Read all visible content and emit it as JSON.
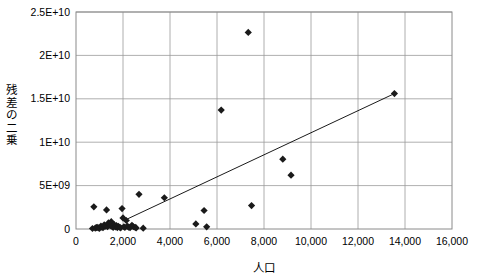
{
  "chart_data": {
    "type": "scatter",
    "title": "",
    "xlabel": "人口",
    "ylabel": "残差の二乗",
    "xlim": [
      0,
      16000
    ],
    "ylim": [
      0,
      25000000000
    ],
    "grid": true,
    "legend": "none",
    "x_tick_labels": [
      "0",
      "2,000",
      "4,000",
      "6,000",
      "8,000",
      "10,000",
      "12,000",
      "14,000",
      "16,000"
    ],
    "x_tick_values": [
      0,
      2000,
      4000,
      6000,
      8000,
      10000,
      12000,
      14000,
      16000
    ],
    "y_tick_labels": [
      "0",
      "5E+09",
      "1E+10",
      "1.5E+10",
      "2E+10",
      "2.5E+10"
    ],
    "y_tick_values": [
      0,
      5000000000,
      10000000000,
      15000000000,
      20000000000,
      25000000000
    ],
    "marker": "diamond",
    "marker_color": "#1a1a1a",
    "series": [
      {
        "name": "残差の二乗",
        "points": [
          [
            700,
            60000000
          ],
          [
            760,
            2550000000
          ],
          [
            820,
            90000000
          ],
          [
            860,
            150000000
          ],
          [
            900,
            200000000
          ],
          [
            950,
            120000000
          ],
          [
            1000,
            80000000
          ],
          [
            1060,
            330000000
          ],
          [
            1100,
            220000000
          ],
          [
            1150,
            150000000
          ],
          [
            1200,
            470000000
          ],
          [
            1250,
            330000000
          ],
          [
            1300,
            2200000000
          ],
          [
            1340,
            260000000
          ],
          [
            1380,
            700000000
          ],
          [
            1420,
            560000000
          ],
          [
            1460,
            380000000
          ],
          [
            1500,
            840000000
          ],
          [
            1540,
            300000000
          ],
          [
            1580,
            180000000
          ],
          [
            1620,
            520000000
          ],
          [
            1680,
            250000000
          ],
          [
            1720,
            400000000
          ],
          [
            1760,
            160000000
          ],
          [
            1800,
            300000000
          ],
          [
            1860,
            200000000
          ],
          [
            1900,
            140000000
          ],
          [
            1960,
            2350000000
          ],
          [
            2000,
            1280000000
          ],
          [
            2040,
            260000000
          ],
          [
            2080,
            170000000
          ],
          [
            2140,
            980000000
          ],
          [
            2180,
            330000000
          ],
          [
            2240,
            210000000
          ],
          [
            2300,
            150000000
          ],
          [
            2380,
            420000000
          ],
          [
            2440,
            260000000
          ],
          [
            2520,
            180000000
          ],
          [
            2560,
            120000000
          ],
          [
            2680,
            4000000000
          ],
          [
            2860,
            90000000
          ],
          [
            3760,
            3600000000
          ],
          [
            5100,
            580000000
          ],
          [
            5450,
            2130000000
          ],
          [
            5560,
            250000000
          ],
          [
            6180,
            13700000000
          ],
          [
            7330,
            22650000000
          ],
          [
            7470,
            2700000000
          ],
          [
            8800,
            8050000000
          ],
          [
            9150,
            6200000000
          ],
          [
            13550,
            15600000000
          ]
        ]
      }
    ],
    "trendline": {
      "type": "linear",
      "x_start": 2180,
      "y_start": 1150000000,
      "x_end": 13550,
      "y_end": 15600000000
    }
  }
}
